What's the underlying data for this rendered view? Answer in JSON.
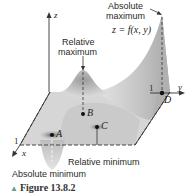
{
  "figure": {
    "caption_marker": "▲",
    "caption": "Figure 13.8.2",
    "annotations": {
      "absolute_maximum_line1": "Absolute",
      "absolute_maximum_line2": "maximum",
      "function_label": "z = f(x, y)",
      "relative_maximum_line1": "Relative",
      "relative_maximum_line2": "maximum",
      "relative_minimum": "Relative minimum",
      "absolute_minimum": "Absolute minimum"
    },
    "axes": {
      "z": "z",
      "y": "y",
      "x": "x",
      "y_tick": "1",
      "x_tick": "1"
    },
    "points": {
      "A": "A",
      "B": "B",
      "C": "C",
      "D": "D"
    },
    "colors": {
      "surface": "#c8c8c8",
      "surface_dark": "#9a9a9a",
      "axis": "#333333",
      "text": "#2a2a2a"
    }
  }
}
